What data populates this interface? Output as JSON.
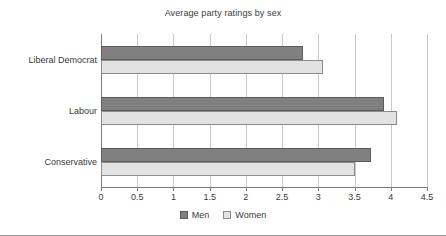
{
  "chart_data": {
    "type": "bar",
    "orientation": "horizontal",
    "title": "Average party ratings by sex",
    "xlabel": "",
    "ylabel": "",
    "categories": [
      "Liberal Democrat",
      "Labour",
      "Conservative"
    ],
    "series": [
      {
        "name": "Men",
        "color": "#808080",
        "values": [
          2.79,
          3.91,
          3.73
        ]
      },
      {
        "name": "Women",
        "color": "#e2e2e2",
        "values": [
          3.06,
          4.08,
          3.51
        ]
      }
    ],
    "xlim": [
      0,
      4.5
    ],
    "xticks": [
      0,
      0.5,
      1,
      1.5,
      2,
      2.5,
      3,
      3.5,
      4,
      4.5
    ],
    "xtick_labels": [
      "0",
      "0.5",
      "1",
      "1.5",
      "2",
      "2.5",
      "3",
      "3.5",
      "4",
      "4.5"
    ],
    "grid": true,
    "grid_axis": "x",
    "legend_position": "bottom",
    "legend": [
      "Men",
      "Women"
    ]
  },
  "colors": {
    "men": "#808080",
    "women": "#e2e2e2",
    "gridline": "#c8c8c8",
    "axis": "#7d7d7d",
    "text": "#3a3a3a",
    "background": "#ffffff"
  }
}
